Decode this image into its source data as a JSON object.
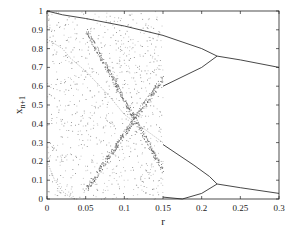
{
  "chart_data": {
    "type": "scatter",
    "title": "",
    "xlabel": "r",
    "ylabel": "x_{n+1}",
    "ylabel_main": "x",
    "ylabel_sub": "n+1",
    "xlim": [
      0,
      0.3
    ],
    "ylim": [
      0,
      1
    ],
    "grid": false,
    "legend": null,
    "xticks": [
      0,
      0.05,
      0.1,
      0.15,
      0.2,
      0.25,
      0.3
    ],
    "xtick_labels": [
      "0",
      "0.05",
      "0.1",
      "0.15",
      "0.2",
      "0.25",
      "0.3"
    ],
    "yticks": [
      0,
      0.1,
      0.2,
      0.3,
      0.4,
      0.5,
      0.6,
      0.7,
      0.8,
      0.9,
      1
    ],
    "ytick_labels": [
      "0",
      "0.1",
      "0.2",
      "0.3",
      "0.4",
      "0.5",
      "0.6",
      "0.7",
      "0.8",
      "0.9",
      "1"
    ],
    "series": [
      {
        "name": "upper-outer branch",
        "x": [
          0.0,
          0.02,
          0.05,
          0.1,
          0.15,
          0.2,
          0.22
        ],
        "y": [
          1.0,
          0.98,
          0.96,
          0.92,
          0.87,
          0.8,
          0.76
        ]
      },
      {
        "name": "upper-inner branch",
        "x": [
          0.15,
          0.2,
          0.22
        ],
        "y": [
          0.6,
          0.7,
          0.76
        ]
      },
      {
        "name": "upper period-2 branch",
        "x": [
          0.22,
          0.25,
          0.3
        ],
        "y": [
          0.76,
          0.74,
          0.7
        ]
      },
      {
        "name": "lower-outer branch",
        "x": [
          0.15,
          0.19,
          0.21,
          0.22
        ],
        "y": [
          0.29,
          0.18,
          0.12,
          0.08
        ]
      },
      {
        "name": "lower-inner branch",
        "x": [
          0.15,
          0.175,
          0.2,
          0.22
        ],
        "y": [
          0.01,
          0.0,
          0.03,
          0.08
        ]
      },
      {
        "name": "lower period-2 branch",
        "x": [
          0.22,
          0.25,
          0.3
        ],
        "y": [
          0.08,
          0.06,
          0.03
        ]
      },
      {
        "name": "chaotic line 1",
        "x": [
          0.0,
          0.02,
          0.03,
          0.05,
          0.08,
          0.1,
          0.15
        ],
        "y": [
          0.85,
          0.8,
          0.75,
          0.68,
          0.55,
          0.45,
          0.3
        ]
      },
      {
        "name": "chaotic line 2",
        "x": [
          0.0,
          0.01,
          0.02,
          0.03,
          0.035,
          0.04
        ],
        "y": [
          0.2,
          0.1,
          0.04,
          0.01,
          0.0,
          0.0
        ]
      }
    ]
  }
}
